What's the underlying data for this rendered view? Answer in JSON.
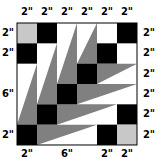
{
  "diagram": {
    "type": "quilt-block",
    "grid": {
      "cols": 6,
      "rows": 6,
      "unit": "2\"",
      "x0": 17,
      "y0": 23,
      "cell_w": 20,
      "cell_h": 20.33
    },
    "colors": {
      "black": "#000000",
      "gray": "#808080",
      "light_gray": "#c8c8c8",
      "white": "#ffffff",
      "outline": "#000000"
    },
    "labels": {
      "top": [
        "2\"",
        "2\"",
        "2\"",
        "2\"",
        "2\"",
        "2\""
      ],
      "right": [
        "2\"",
        "2\"",
        "2\"",
        "2\"",
        "2\"",
        "2\""
      ],
      "left": [
        {
          "text": "2\"",
          "row_center": 0.5
        },
        {
          "text": "2\"",
          "row_center": 1.5
        },
        {
          "text": "6\"",
          "row_center": 3.5
        },
        {
          "text": "2\"",
          "row_center": 5.5
        }
      ],
      "bottom": [
        {
          "text": "2\"",
          "col_center": 0.5
        },
        {
          "text": "6\"",
          "col_center": 2.5
        },
        {
          "text": "2\"",
          "col_center": 4.5
        },
        {
          "text": "2\"",
          "col_center": 5.5
        }
      ]
    },
    "squares": [
      {
        "col": 0,
        "row": 0,
        "fill": "light_gray"
      },
      {
        "col": 1,
        "row": 0,
        "fill": "black"
      },
      {
        "col": 5,
        "row": 0,
        "fill": "black"
      },
      {
        "col": 0,
        "row": 1,
        "fill": "black"
      },
      {
        "col": 4,
        "row": 1,
        "fill": "black"
      },
      {
        "col": 3,
        "row": 2,
        "fill": "black"
      },
      {
        "col": 2,
        "row": 3,
        "fill": "black"
      },
      {
        "col": 1,
        "row": 4,
        "fill": "black"
      },
      {
        "col": 5,
        "row": 4,
        "fill": "black"
      },
      {
        "col": 0,
        "row": 5,
        "fill": "black"
      },
      {
        "col": 4,
        "row": 5,
        "fill": "black"
      },
      {
        "col": 5,
        "row": 5,
        "fill": "light_gray"
      }
    ],
    "triangles": [
      {
        "points": [
          [
            0,
            5
          ],
          [
            1,
            5
          ],
          [
            1,
            2
          ]
        ],
        "fill": "gray",
        "orient": "vertical"
      },
      {
        "points": [
          [
            1,
            4
          ],
          [
            2,
            4
          ],
          [
            2,
            1
          ]
        ],
        "fill": "gray",
        "orient": "vertical"
      },
      {
        "points": [
          [
            2,
            3
          ],
          [
            3,
            3
          ],
          [
            3,
            0
          ]
        ],
        "fill": "gray",
        "orient": "vertical"
      },
      {
        "points": [
          [
            3,
            2
          ],
          [
            4,
            2
          ],
          [
            4,
            0
          ]
        ],
        "fill": "gray",
        "orient": "vertical"
      },
      {
        "points": [
          [
            4,
            2
          ],
          [
            4,
            3
          ],
          [
            6,
            2
          ]
        ],
        "fill": "gray",
        "orient": "horizontal"
      },
      {
        "points": [
          [
            3,
            3
          ],
          [
            3,
            4
          ],
          [
            6,
            3
          ]
        ],
        "fill": "gray",
        "orient": "horizontal"
      },
      {
        "points": [
          [
            2,
            4
          ],
          [
            2,
            5
          ],
          [
            5,
            4
          ]
        ],
        "fill": "gray",
        "orient": "horizontal"
      },
      {
        "points": [
          [
            1,
            5
          ],
          [
            1,
            6
          ],
          [
            4,
            5
          ]
        ],
        "fill": "gray",
        "orient": "horizontal"
      }
    ]
  }
}
